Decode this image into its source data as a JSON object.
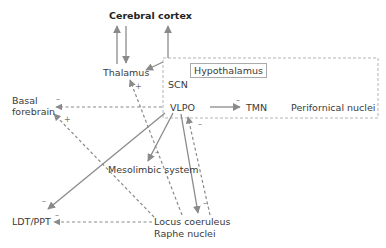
{
  "nodes": {
    "cerebral_cortex": "Cerebral cortex",
    "thalamus": "Thalamus",
    "hypothalamus": "Hypothalamus",
    "scn": "SCN",
    "vlpo": "VLPO",
    "tmn": "TMN",
    "perifornical": "Perifornical nuclei",
    "basal_forebrain_1": "Basal",
    "basal_forebrain_2": "forebrain",
    "mesolimbic": "Mesolimbic system",
    "ldt_ppt": "LDT/PPT",
    "locus_coeruleus": "Locus coeruleus",
    "raphe": "Raphe nuclei"
  },
  "signs": {
    "minus": "–",
    "plus": "+"
  },
  "colors": {
    "arrow": "#8a8a8a",
    "text": "#3a3a3a",
    "box": "#aaaaaa"
  }
}
